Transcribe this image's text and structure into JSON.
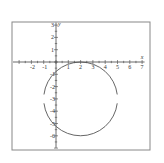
{
  "figure": {
    "frame_color": "#888888",
    "axis_color": "#444444",
    "curve_color": "#555555"
  },
  "axes": {
    "x_label": "x",
    "y_label": "y",
    "x_ticks": [
      "-2",
      "-1",
      "1",
      "2",
      "3",
      "4",
      "5",
      "6",
      "7"
    ],
    "y_ticks": [
      "3",
      "2",
      "1",
      "-1",
      "-2",
      "-3",
      "-4",
      "-5",
      "-6"
    ],
    "xlim": [
      -3,
      7
    ],
    "ylim": [
      -7,
      3
    ]
  },
  "chart_data": {
    "type": "scatter",
    "title": "",
    "xlabel": "x",
    "ylabel": "y",
    "xlim": [
      -3,
      7
    ],
    "ylim": [
      -7,
      3
    ],
    "grid": false,
    "series": [
      {
        "name": "circle",
        "shape": "circle",
        "center": [
          2,
          -3
        ],
        "radius": 3,
        "equation": "(x-2)^2 + (y+3)^2 = 9"
      }
    ]
  }
}
